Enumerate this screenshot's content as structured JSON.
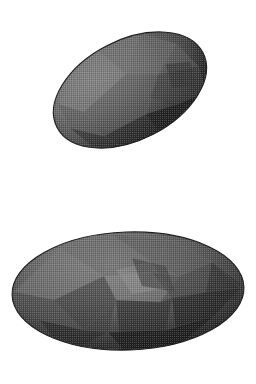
{
  "document": {
    "title": "3D Faceted Ellipsoid Mesh Render",
    "background_color": "#ffffff",
    "width": 256,
    "height": 384,
    "render_style": "dithered wireframe shaded polygon mesh",
    "object_count": 2
  },
  "palette": {
    "background": "#ffffff",
    "mesh_base": "#6b6b6b",
    "mesh_mid": "#555555",
    "mesh_dark": "#3a3a3a",
    "mesh_darkest": "#1b1b1b",
    "mesh_light": "#8a8a8a",
    "mesh_highlight": "#9c9c9c",
    "wire_color": "#2e2e2e",
    "outline": "#242424"
  },
  "objects": [
    {
      "id": "top-ellipsoid",
      "name": "tilted-faceted-ellipsoid",
      "shape": "prolate ellipsoid / football",
      "center": {
        "x": 130,
        "y": 90
      },
      "radius_x": 82,
      "radius_y": 50,
      "rotation_deg": -27,
      "bounds": {
        "x_min": 50,
        "x_max": 211,
        "y_min": 27,
        "y_max": 152
      },
      "shading": "lit from upper-left, darkest toward lower-right",
      "facets": [
        {
          "name": "upper-left-lobe",
          "fill": "#7a7a7a"
        },
        {
          "name": "upper-crown",
          "fill": "#6e6e6e"
        },
        {
          "name": "mid-band-left",
          "fill": "#737373"
        },
        {
          "name": "mid-band-center",
          "fill": "#606060"
        },
        {
          "name": "right-quad-panel",
          "fill": "#3e3e3e"
        },
        {
          "name": "lower-right-shadow",
          "fill": "#222222"
        },
        {
          "name": "lower-center-shadow",
          "fill": "#333333"
        },
        {
          "name": "left-tip-panel",
          "fill": "#5a5a5a"
        }
      ]
    },
    {
      "id": "bottom-ellipsoid",
      "name": "horizontal-faceted-ellipsoid",
      "shape": "prolate ellipsoid / lemon",
      "center": {
        "x": 128,
        "y": 291
      },
      "radius_x": 116,
      "radius_y": 59,
      "rotation_deg": -2,
      "bounds": {
        "x_min": 12,
        "x_max": 244,
        "y_min": 232,
        "y_max": 350
      },
      "shading": "lit from upper-left, darkest toward lower-right and tips",
      "facets": [
        {
          "name": "left-wing",
          "fill": "#6f6f6f"
        },
        {
          "name": "upper-center-crown",
          "fill": "#636363"
        },
        {
          "name": "center-star-highlight",
          "fill": "#8f8f8f"
        },
        {
          "name": "center-star-dark",
          "fill": "#3c3c3c"
        },
        {
          "name": "right-wing",
          "fill": "#4a4a4a"
        },
        {
          "name": "lower-center-shadow",
          "fill": "#2d2d2d"
        },
        {
          "name": "lower-right-shadow",
          "fill": "#1f1f1f"
        },
        {
          "name": "right-tip-dark",
          "fill": "#262626"
        }
      ]
    }
  ],
  "mesh": {
    "wire_pattern": "dense triangulated stipple",
    "wire_cell_px": 2,
    "wire_opacity": 0.38,
    "description": "fine dithered checkerboard texture from densely tessellated wireframe"
  }
}
